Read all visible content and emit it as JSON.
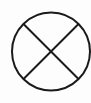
{
  "diagram": {
    "symbol": "circle-with-x",
    "stroke_color": "#1a1a1a",
    "background_color": "#fdfdfd",
    "circle": {
      "cx": 51,
      "cy": 51.5,
      "r": 39
    },
    "lines": [
      {
        "x1": 23.5,
        "y1": 24,
        "x2": 78.5,
        "y2": 79
      },
      {
        "x1": 78.5,
        "y1": 24,
        "x2": 23.5,
        "y2": 79
      }
    ],
    "stroke_width": 2
  }
}
